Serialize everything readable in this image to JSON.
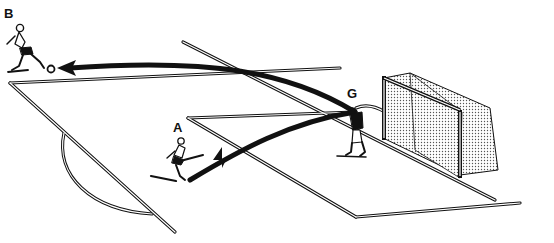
{
  "diagram": {
    "type": "soccer-drill-illustration",
    "players": [
      {
        "id": "B",
        "label": "B",
        "role": "receiver",
        "x": 22,
        "y": 18
      },
      {
        "id": "A",
        "label": "A",
        "role": "kicker",
        "x": 172,
        "y": 125
      },
      {
        "id": "G",
        "label": "G",
        "role": "goalkeeper",
        "x": 350,
        "y": 90
      }
    ],
    "passes": [
      {
        "from": "A",
        "to": "G",
        "description": "shot from A toward goalkeeper"
      },
      {
        "from": "G",
        "to": "B",
        "description": "goalkeeper throw/kick out to B"
      }
    ],
    "elements": [
      "penalty-area",
      "goal-area",
      "penalty-arc",
      "goal-with-net",
      "ball"
    ],
    "colors": {
      "ink": "#111111",
      "background": "#ffffff",
      "net": "#9a9a9a"
    }
  }
}
